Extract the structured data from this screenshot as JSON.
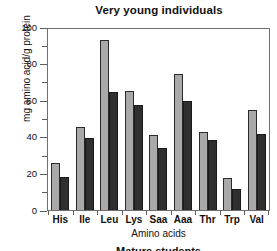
{
  "chart_data": {
    "type": "bar",
    "title": "Very young individuals",
    "xlabel": "Amino acids",
    "ylabel": "mg amino acid/g protein",
    "categories": [
      "His",
      "Ile",
      "Leu",
      "Lys",
      "Saa",
      "Aaa",
      "Thr",
      "Trp",
      "Val"
    ],
    "series": [
      {
        "name": "light-series",
        "color": "#a9a9a9",
        "values": [
          26,
          46,
          94,
          66,
          41.5,
          75,
          43,
          17.5,
          55.5
        ]
      },
      {
        "name": "dark-series",
        "color": "#2f2f2f",
        "values": [
          18.5,
          40,
          65,
          58,
          34,
          60.5,
          38.5,
          11.5,
          42
        ]
      }
    ],
    "ylim": [
      0,
      100
    ],
    "yticks": [
      0,
      20,
      40,
      60,
      80,
      100
    ],
    "yticks_minor": [
      10,
      30,
      50,
      70,
      90
    ],
    "grid": false,
    "legend": "none"
  },
  "bottom_caption": "Mature students"
}
